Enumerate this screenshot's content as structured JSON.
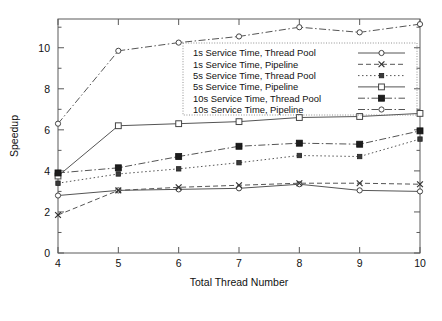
{
  "chart_data": {
    "type": "line",
    "title": "",
    "xlabel": "Total Thread Number",
    "ylabel": "Speedup",
    "x": [
      4,
      5,
      6,
      7,
      8,
      9,
      10
    ],
    "xlim": [
      4,
      10
    ],
    "ylim": [
      0,
      11.4
    ],
    "xticks": [
      "4",
      "5",
      "6",
      "7",
      "8",
      "9",
      "10"
    ],
    "yticks": [
      "0",
      "2",
      "4",
      "6",
      "8",
      "10"
    ],
    "grid": false,
    "legend_position": "upper-center",
    "series": [
      {
        "name": "1s Service Time, Thread Pool",
        "values": [
          2.8,
          3.05,
          3.1,
          3.15,
          3.35,
          3.05,
          3.0
        ],
        "marker": "open-circle",
        "dash": "solid"
      },
      {
        "name": "1s Service Time, Pipeline",
        "values": [
          1.85,
          3.05,
          3.2,
          3.3,
          3.4,
          3.4,
          3.35
        ],
        "marker": "cross",
        "dash": "dashed"
      },
      {
        "name": "5s Service Time, Thread Pool",
        "values": [
          3.4,
          3.85,
          4.1,
          4.4,
          4.75,
          4.7,
          5.55
        ],
        "marker": "small-filled-square",
        "dash": "dotted"
      },
      {
        "name": "5s Service Time, Pipeline",
        "values": [
          3.75,
          6.2,
          6.3,
          6.4,
          6.6,
          6.65,
          6.8
        ],
        "marker": "open-square",
        "dash": "solid"
      },
      {
        "name": "10s Service Time, Thread Pool",
        "values": [
          3.9,
          4.15,
          4.7,
          5.2,
          5.35,
          5.3,
          5.95
        ],
        "marker": "filled-square",
        "dash": "dash-dot"
      },
      {
        "name": "10s Service Time, Pipeline",
        "values": [
          6.3,
          9.85,
          10.25,
          10.55,
          11.0,
          10.75,
          11.15
        ],
        "marker": "open-circle",
        "dash": "dash-dot"
      }
    ]
  },
  "colors": {
    "line": "#555555",
    "axis": "#5a5a5a",
    "text": "#111111",
    "background": "#ffffff"
  }
}
